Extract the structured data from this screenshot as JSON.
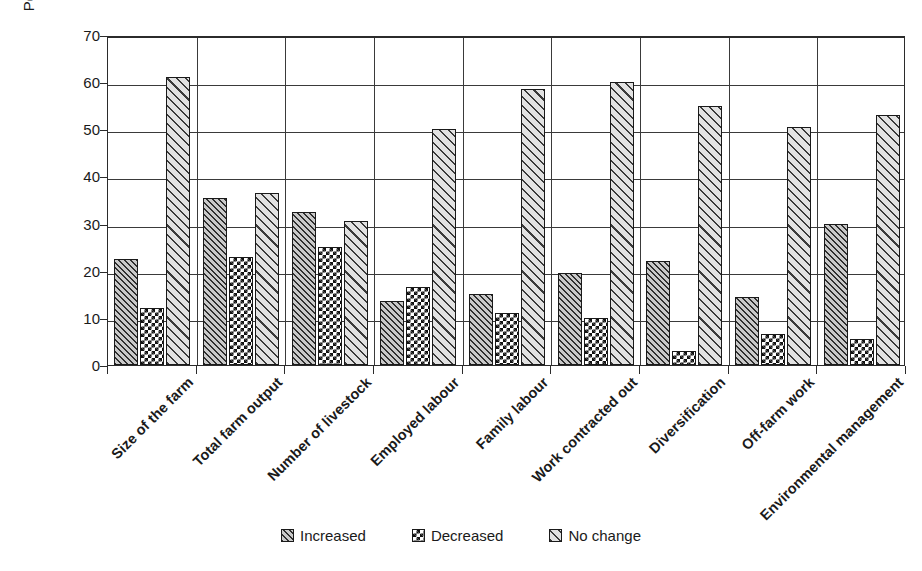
{
  "chart_data": {
    "type": "bar",
    "title": "",
    "xlabel": "",
    "ylabel": "Percentage of respondents (%)",
    "ylim": [
      0,
      70
    ],
    "ytick_step": 10,
    "yticks": [
      70,
      60,
      50,
      40,
      30,
      20,
      10,
      0
    ],
    "grid": "horizontal-and-category-separators",
    "legend_position": "bottom-center",
    "categories": [
      "Size of the farm",
      "Total farm output",
      "Number of livestock",
      "Employed labour",
      "Family labour",
      "Work contracted out",
      "Diversification",
      "Off-farm work",
      "Environmental management"
    ],
    "series": [
      {
        "name": "Increased",
        "pattern": "dense-diagonal-hatch",
        "values": [
          22.5,
          35.5,
          32.5,
          13.5,
          15.0,
          19.5,
          22.0,
          14.5,
          30.0
        ]
      },
      {
        "name": "Decreased",
        "pattern": "checkerboard",
        "values": [
          12.0,
          23.0,
          25.0,
          16.5,
          11.0,
          10.0,
          3.0,
          6.5,
          5.5
        ]
      },
      {
        "name": "No change",
        "pattern": "wide-diagonal-hatch",
        "values": [
          61.0,
          36.5,
          30.5,
          50.0,
          58.5,
          60.0,
          55.0,
          50.5,
          53.0
        ]
      }
    ]
  },
  "legend": {
    "items": [
      {
        "label": "Increased"
      },
      {
        "label": "Decreased"
      },
      {
        "label": "No change"
      }
    ]
  },
  "colors": {
    "axis": "#2b2b2b",
    "grid": "#3a3a3a",
    "text": "#1a1a1a",
    "background": "#ffffff"
  }
}
